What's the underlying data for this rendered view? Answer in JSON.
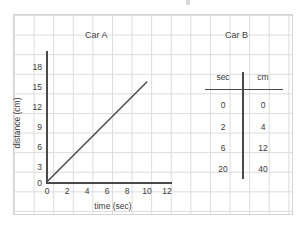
{
  "page": {
    "background_color": "#ffffff",
    "grid_color": "#dcdcdc",
    "ink_color": "#3a3a3a"
  },
  "chart_data": {
    "type": "line",
    "title": "Car A",
    "xlabel": "time (sec)",
    "ylabel": "distance (cm)",
    "xlim": [
      0,
      13
    ],
    "ylim": [
      0,
      19
    ],
    "xticks": [
      0,
      2,
      4,
      6,
      8,
      10,
      12
    ],
    "xtick_labels": [
      "0",
      "2",
      "4",
      "6",
      "8",
      "10",
      "12"
    ],
    "yticks": [
      0,
      3,
      6,
      9,
      12,
      15,
      18
    ],
    "ytick_labels": [
      "0",
      "3",
      "6",
      "9",
      "12",
      "15",
      "18"
    ],
    "grid": true,
    "legend": "none",
    "series": [
      {
        "name": "Car A",
        "x": [
          0,
          10
        ],
        "y": [
          0,
          15
        ],
        "color": "#4a4a4a"
      }
    ]
  },
  "table_panel": {
    "title": "Car B",
    "columns": [
      "sec",
      "cm"
    ],
    "rows": [
      {
        "sec": "0",
        "cm": "0"
      },
      {
        "sec": "2",
        "cm": "4"
      },
      {
        "sec": "6",
        "cm": "12"
      },
      {
        "sec": "20",
        "cm": "40"
      }
    ]
  }
}
